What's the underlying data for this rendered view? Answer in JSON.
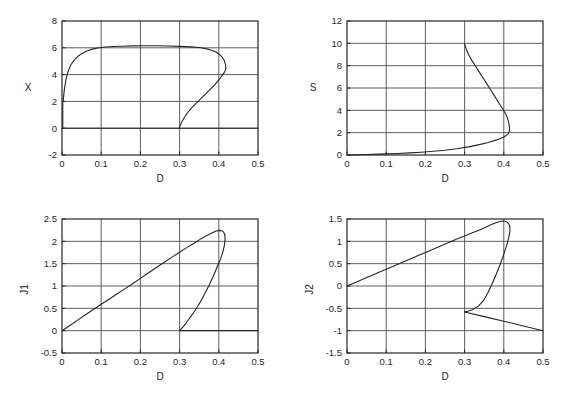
{
  "figure": {
    "background": "#ffffff",
    "line_color": "#262626",
    "grid_color": "#4d4d4d",
    "axis_color": "#262626"
  },
  "chart_data": [
    {
      "type": "line",
      "name": "X-vs-D",
      "title": "",
      "xlabel": "D",
      "ylabel": "X",
      "xlim": [
        0,
        0.5
      ],
      "ylim": [
        -2,
        8
      ],
      "xticks": [
        0,
        0.1,
        0.2,
        0.3,
        0.4,
        0.5
      ],
      "xticklabels": [
        "0",
        "0.1",
        "0.2",
        "0.3",
        "0.4",
        "0.5"
      ],
      "yticks": [
        -2,
        0,
        2,
        4,
        6,
        8
      ],
      "yticklabels": [
        "-2",
        "0",
        "2",
        "4",
        "6",
        "8"
      ],
      "grid": true,
      "legend": "none",
      "series": [
        {
          "name": "stable-washout-branch",
          "points": [
            [
              0.0,
              0.0
            ],
            [
              0.1,
              0.0
            ],
            [
              0.2,
              0.0
            ],
            [
              0.3,
              0.0
            ],
            [
              0.35,
              0.0
            ],
            [
              0.4,
              0.0
            ],
            [
              0.45,
              0.0
            ],
            [
              0.5,
              0.0
            ]
          ]
        },
        {
          "name": "vertical-segment-at-origin",
          "points": [
            [
              0.002,
              0.0
            ],
            [
              0.002,
              0.7
            ],
            [
              0.002,
              1.4
            ],
            [
              0.002,
              2.0
            ]
          ]
        },
        {
          "name": "upper-stable-branch",
          "points": [
            [
              0.003,
              2.0
            ],
            [
              0.006,
              2.9
            ],
            [
              0.01,
              3.6
            ],
            [
              0.015,
              4.2
            ],
            [
              0.022,
              4.7
            ],
            [
              0.03,
              5.05
            ],
            [
              0.04,
              5.35
            ],
            [
              0.052,
              5.6
            ],
            [
              0.065,
              5.78
            ],
            [
              0.08,
              5.92
            ],
            [
              0.095,
              6.0
            ],
            [
              0.11,
              6.06
            ],
            [
              0.13,
              6.1
            ],
            [
              0.15,
              6.12
            ],
            [
              0.18,
              6.14
            ],
            [
              0.21,
              6.15
            ],
            [
              0.24,
              6.15
            ],
            [
              0.27,
              6.13
            ],
            [
              0.3,
              6.11
            ],
            [
              0.33,
              6.07
            ],
            [
              0.355,
              6.0
            ],
            [
              0.375,
              5.88
            ],
            [
              0.39,
              5.72
            ],
            [
              0.4,
              5.55
            ],
            [
              0.408,
              5.33
            ],
            [
              0.414,
              5.05
            ],
            [
              0.417,
              4.75
            ],
            [
              0.418,
              4.45
            ]
          ]
        },
        {
          "name": "unstable-branch",
          "points": [
            [
              0.418,
              4.45
            ],
            [
              0.415,
              4.2
            ],
            [
              0.41,
              4.0
            ],
            [
              0.4,
              3.6
            ],
            [
              0.39,
              3.25
            ],
            [
              0.378,
              2.9
            ],
            [
              0.366,
              2.55
            ],
            [
              0.354,
              2.2
            ],
            [
              0.342,
              1.85
            ],
            [
              0.33,
              1.5
            ],
            [
              0.32,
              1.15
            ],
            [
              0.312,
              0.8
            ],
            [
              0.305,
              0.45
            ],
            [
              0.3,
              0.1
            ],
            [
              0.2995,
              0.0
            ]
          ]
        }
      ]
    },
    {
      "type": "line",
      "name": "S-vs-D",
      "title": "",
      "xlabel": "D",
      "ylabel": "S",
      "xlim": [
        0,
        0.5
      ],
      "ylim": [
        0,
        12
      ],
      "xticks": [
        0,
        0.1,
        0.2,
        0.3,
        0.4,
        0.5
      ],
      "xticklabels": [
        "0",
        "0.1",
        "0.2",
        "0.3",
        "0.4",
        "0.5"
      ],
      "yticks": [
        0,
        2,
        4,
        6,
        8,
        10,
        12
      ],
      "yticklabels": [
        "0",
        "2",
        "4",
        "6",
        "8",
        "10",
        "12"
      ],
      "grid": true,
      "legend": "none",
      "series": [
        {
          "name": "lower-stable-branch",
          "points": [
            [
              0.0,
              0.0
            ],
            [
              0.02,
              0.02
            ],
            [
              0.05,
              0.05
            ],
            [
              0.08,
              0.08
            ],
            [
              0.1,
              0.1
            ],
            [
              0.13,
              0.14
            ],
            [
              0.16,
              0.19
            ],
            [
              0.19,
              0.25
            ],
            [
              0.22,
              0.33
            ],
            [
              0.25,
              0.43
            ],
            [
              0.28,
              0.56
            ],
            [
              0.31,
              0.73
            ],
            [
              0.34,
              0.95
            ],
            [
              0.36,
              1.12
            ],
            [
              0.38,
              1.33
            ],
            [
              0.39,
              1.46
            ],
            [
              0.4,
              1.62
            ],
            [
              0.405,
              1.72
            ],
            [
              0.41,
              1.85
            ],
            [
              0.413,
              2.0
            ],
            [
              0.4145,
              2.2
            ]
          ]
        },
        {
          "name": "turning-and-unstable-branch",
          "points": [
            [
              0.4145,
              2.2
            ],
            [
              0.4145,
              2.45
            ],
            [
              0.4135,
              2.75
            ],
            [
              0.4115,
              3.05
            ],
            [
              0.409,
              3.35
            ],
            [
              0.406,
              3.6
            ],
            [
              0.402,
              3.85
            ],
            [
              0.3985,
              4.05
            ],
            [
              0.394,
              4.3
            ],
            [
              0.386,
              4.75
            ],
            [
              0.377,
              5.25
            ],
            [
              0.368,
              5.75
            ],
            [
              0.358,
              6.3
            ],
            [
              0.348,
              6.85
            ],
            [
              0.338,
              7.4
            ],
            [
              0.328,
              7.95
            ],
            [
              0.318,
              8.5
            ],
            [
              0.31,
              9.0
            ],
            [
              0.304,
              9.5
            ],
            [
              0.3,
              9.95
            ]
          ]
        }
      ]
    },
    {
      "type": "line",
      "name": "J1-vs-D",
      "title": "",
      "xlabel": "D",
      "ylabel": "J1",
      "xlim": [
        0,
        0.5
      ],
      "ylim": [
        -0.5,
        2.5
      ],
      "xticks": [
        0,
        0.1,
        0.2,
        0.3,
        0.4,
        0.5
      ],
      "xticklabels": [
        "0",
        "0.1",
        "0.2",
        "0.3",
        "0.4",
        "0.5"
      ],
      "yticks": [
        -0.5,
        0,
        0.5,
        1,
        1.5,
        2,
        2.5
      ],
      "yticklabels": [
        "-0.5",
        "0",
        "0.5",
        "1",
        "1.5",
        "2",
        "2.5"
      ],
      "grid": true,
      "legend": "none",
      "series": [
        {
          "name": "zero-branch",
          "points": [
            [
              0.3,
              0.0
            ],
            [
              0.34,
              0.0
            ],
            [
              0.38,
              0.0
            ],
            [
              0.42,
              0.0
            ],
            [
              0.46,
              0.0
            ],
            [
              0.5,
              0.0
            ]
          ]
        },
        {
          "name": "upper-stable-branch",
          "points": [
            [
              0.0,
              0.0
            ],
            [
              0.02,
              0.115
            ],
            [
              0.04,
              0.235
            ],
            [
              0.06,
              0.355
            ],
            [
              0.08,
              0.475
            ],
            [
              0.1,
              0.59
            ],
            [
              0.12,
              0.705
            ],
            [
              0.14,
              0.82
            ],
            [
              0.16,
              0.935
            ],
            [
              0.18,
              1.05
            ],
            [
              0.2,
              1.17
            ],
            [
              0.22,
              1.29
            ],
            [
              0.24,
              1.41
            ],
            [
              0.26,
              1.525
            ],
            [
              0.28,
              1.64
            ],
            [
              0.3,
              1.755
            ],
            [
              0.32,
              1.87
            ],
            [
              0.34,
              1.975
            ],
            [
              0.355,
              2.06
            ],
            [
              0.37,
              2.13
            ],
            [
              0.382,
              2.185
            ],
            [
              0.392,
              2.225
            ],
            [
              0.4,
              2.245
            ],
            [
              0.407,
              2.24
            ],
            [
              0.412,
              2.21
            ],
            [
              0.4155,
              2.15
            ]
          ]
        },
        {
          "name": "unstable-branch",
          "points": [
            [
              0.4155,
              2.15
            ],
            [
              0.416,
              2.05
            ],
            [
              0.414,
              1.9
            ],
            [
              0.41,
              1.75
            ],
            [
              0.4045,
              1.6
            ],
            [
              0.4,
              1.52
            ],
            [
              0.393,
              1.37
            ],
            [
              0.385,
              1.2
            ],
            [
              0.376,
              1.03
            ],
            [
              0.366,
              0.86
            ],
            [
              0.356,
              0.69
            ],
            [
              0.345,
              0.53
            ],
            [
              0.334,
              0.38
            ],
            [
              0.323,
              0.25
            ],
            [
              0.312,
              0.12
            ],
            [
              0.303,
              0.03
            ],
            [
              0.3,
              0.0
            ]
          ]
        }
      ]
    },
    {
      "type": "line",
      "name": "J2-vs-D",
      "title": "",
      "xlabel": "D",
      "ylabel": "J2",
      "xlim": [
        0,
        0.5
      ],
      "ylim": [
        -1.5,
        1.5
      ],
      "xticks": [
        0,
        0.1,
        0.2,
        0.3,
        0.4,
        0.5
      ],
      "xticklabels": [
        "0",
        "0.1",
        "0.2",
        "0.3",
        "0.4",
        "0.5"
      ],
      "yticks": [
        -1.5,
        -1,
        -0.5,
        0,
        0.5,
        1,
        1.5
      ],
      "yticklabels": [
        "-1.5",
        "-1",
        "-0.5",
        "0",
        "0.5",
        "1",
        "1.5"
      ],
      "grid": true,
      "legend": "none",
      "series": [
        {
          "name": "descending-line",
          "points": [
            [
              0.3,
              -0.58
            ],
            [
              0.35,
              -0.685
            ],
            [
              0.4,
              -0.79
            ],
            [
              0.45,
              -0.895
            ],
            [
              0.5,
              -1.0
            ]
          ]
        },
        {
          "name": "upper-stable-branch",
          "points": [
            [
              0.0,
              0.0
            ],
            [
              0.02,
              0.075
            ],
            [
              0.04,
              0.15
            ],
            [
              0.06,
              0.225
            ],
            [
              0.08,
              0.3
            ],
            [
              0.1,
              0.375
            ],
            [
              0.12,
              0.45
            ],
            [
              0.14,
              0.525
            ],
            [
              0.16,
              0.6
            ],
            [
              0.18,
              0.675
            ],
            [
              0.2,
              0.75
            ],
            [
              0.22,
              0.825
            ],
            [
              0.24,
              0.9
            ],
            [
              0.26,
              0.975
            ],
            [
              0.28,
              1.05
            ],
            [
              0.3,
              1.12
            ],
            [
              0.32,
              1.19
            ],
            [
              0.34,
              1.26
            ],
            [
              0.355,
              1.32
            ],
            [
              0.37,
              1.38
            ],
            [
              0.382,
              1.42
            ],
            [
              0.392,
              1.45
            ],
            [
              0.4,
              1.455
            ],
            [
              0.407,
              1.44
            ],
            [
              0.412,
              1.4
            ],
            [
              0.4155,
              1.33
            ]
          ]
        },
        {
          "name": "unstable-branch",
          "points": [
            [
              0.4155,
              1.33
            ],
            [
              0.4155,
              1.22
            ],
            [
              0.413,
              1.1
            ],
            [
              0.409,
              0.96
            ],
            [
              0.404,
              0.82
            ],
            [
              0.398,
              0.66
            ],
            [
              0.39,
              0.47
            ],
            [
              0.381,
              0.27
            ],
            [
              0.371,
              0.06
            ],
            [
              0.36,
              -0.14
            ],
            [
              0.348,
              -0.33
            ],
            [
              0.335,
              -0.45
            ],
            [
              0.32,
              -0.53
            ],
            [
              0.308,
              -0.565
            ],
            [
              0.3,
              -0.58
            ]
          ]
        }
      ]
    }
  ]
}
